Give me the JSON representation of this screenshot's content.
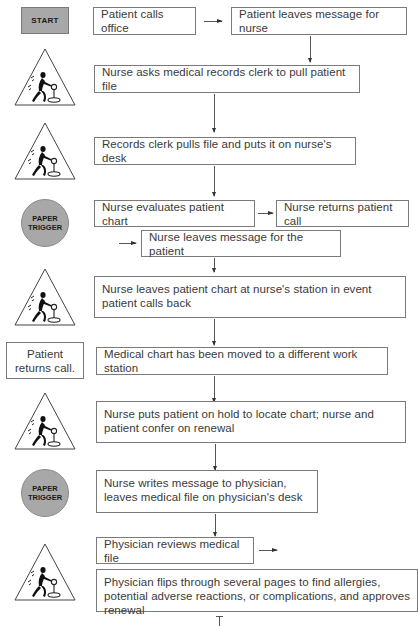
{
  "flowchart": {
    "start_label": "START",
    "paper_trigger_label": "PAPER TRIGGER",
    "paper_trigger_lines": [
      "PAPER",
      "TRIGGER"
    ],
    "icons": {
      "shape_triangle": "worker-pushing-cart-icon",
      "shape_circle": "paper-trigger-badge",
      "shape_rect": "start-badge"
    },
    "steps": [
      {
        "id": "s1",
        "text": "Patient calls office"
      },
      {
        "id": "s2",
        "text": "Patient leaves message for nurse"
      },
      {
        "id": "s3",
        "text": "Nurse asks medical records clerk to pull patient file"
      },
      {
        "id": "s4",
        "text": "Records clerk pulls file and puts it on nurse's desk"
      },
      {
        "id": "s5",
        "text": "Nurse evaluates patient chart"
      },
      {
        "id": "s6",
        "text": "Nurse returns patient call"
      },
      {
        "id": "s7",
        "text": "Nurse leaves message for the patient"
      },
      {
        "id": "s8",
        "text": "Nurse leaves patient chart at nurse's station in event patient calls back"
      },
      {
        "id": "s9",
        "text": "Medical chart has been moved to a different work station"
      },
      {
        "id": "s10",
        "text": "Nurse puts patient on hold to locate chart; nurse and patient confer on renewal"
      },
      {
        "id": "s11",
        "text": "Nurse writes message to physician, leaves medical file on physician's desk"
      },
      {
        "id": "s12",
        "text": "Physician reviews medical file"
      },
      {
        "id": "s13",
        "text": "Physician flips through several pages to find allergies, potential adverse reactions, or complications, and approves renewal"
      }
    ],
    "side_note": {
      "text": "Patient returns call."
    },
    "colors": {
      "badge_fill": "#a8a8a8",
      "box_border": "#7a7a7a",
      "text": "#3a3a3a",
      "background": "#ffffff"
    }
  }
}
